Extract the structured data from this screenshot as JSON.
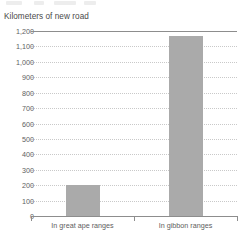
{
  "chart_data": {
    "type": "bar",
    "title": "Kilometers of new road",
    "xlabel": "",
    "ylabel": "",
    "categories": [
      "In great ape ranges",
      "In gibbon ranges"
    ],
    "values": [
      200,
      1170
    ],
    "series": [
      {
        "name": "Kilometers of new road",
        "values": [
          200,
          1170
        ]
      }
    ],
    "ylim": [
      0,
      1200
    ],
    "y_tick_step": 100,
    "y_tick_labels": [
      "1,200",
      "1,100",
      "1,000",
      "900",
      "800",
      "700",
      "600",
      "500",
      "400",
      "300",
      "200",
      "100",
      "0"
    ],
    "y_tick_values": [
      1200,
      1100,
      1000,
      900,
      800,
      700,
      600,
      500,
      400,
      300,
      200,
      100,
      0
    ],
    "grid": true,
    "grid_style": "dotted-horizontal",
    "legend": false,
    "legend_position": "none",
    "bar_color": "#aaaaaa",
    "grid_color": "#c9c9c9",
    "axis_color": "#8d8d8d",
    "title_color": "#4a4a4a",
    "tick_label_color": "#5e5e5e",
    "background_color": "#ffffff"
  }
}
